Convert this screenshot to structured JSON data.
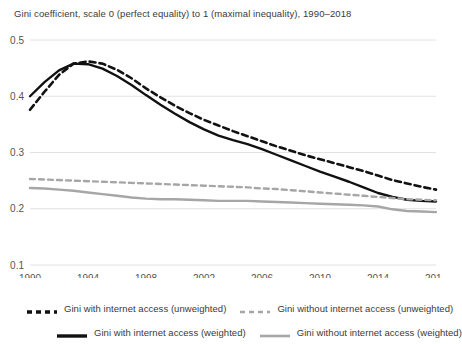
{
  "chart_data": {
    "type": "line",
    "title": "Gini coefficient, scale 0 (perfect equality) to 1 (maximal inequality), 1990–2018",
    "xlabel": "",
    "ylabel": "",
    "xlim": [
      1990,
      2018
    ],
    "ylim": [
      0.1,
      0.5
    ],
    "grid": true,
    "legend_position": "bottom",
    "yticks": [
      "0.1",
      "0.2",
      "0.3",
      "0.4",
      "0.5"
    ],
    "ytick_values": [
      0.1,
      0.2,
      0.3,
      0.4,
      0.5
    ],
    "xticks": [
      "1990",
      "1994",
      "1998",
      "2002",
      "2006",
      "2010",
      "2014",
      "2018"
    ],
    "xtick_values": [
      1990,
      1994,
      1998,
      2002,
      2006,
      2010,
      2014,
      2018
    ],
    "x": [
      1990,
      1991,
      1992,
      1993,
      1994,
      1995,
      1996,
      1997,
      1998,
      1999,
      2000,
      2001,
      2002,
      2003,
      2004,
      2005,
      2006,
      2007,
      2008,
      2009,
      2010,
      2011,
      2012,
      2013,
      2014,
      2015,
      2016,
      2017,
      2018
    ],
    "series": [
      {
        "name": "Gini with internet access (unweighted)",
        "style": "dashed",
        "color": "#111111",
        "width": 2.6,
        "values": [
          0.376,
          0.408,
          0.438,
          0.458,
          0.462,
          0.458,
          0.447,
          0.432,
          0.414,
          0.398,
          0.383,
          0.37,
          0.358,
          0.348,
          0.338,
          0.329,
          0.32,
          0.311,
          0.303,
          0.295,
          0.288,
          0.281,
          0.274,
          0.267,
          0.259,
          0.251,
          0.245,
          0.239,
          0.234
        ]
      },
      {
        "name": "Gini with internet access (weighted)",
        "style": "solid",
        "color": "#111111",
        "width": 2.4,
        "values": [
          0.4,
          0.425,
          0.446,
          0.458,
          0.457,
          0.449,
          0.436,
          0.42,
          0.402,
          0.385,
          0.369,
          0.354,
          0.341,
          0.33,
          0.322,
          0.315,
          0.306,
          0.296,
          0.286,
          0.276,
          0.266,
          0.257,
          0.248,
          0.238,
          0.228,
          0.221,
          0.216,
          0.214,
          0.213
        ]
      },
      {
        "name": "Gini without internet access (unweighted)",
        "style": "dashed",
        "color": "#a6a6a6",
        "width": 2.4,
        "values": [
          0.253,
          0.252,
          0.251,
          0.25,
          0.249,
          0.248,
          0.247,
          0.246,
          0.245,
          0.244,
          0.243,
          0.242,
          0.241,
          0.24,
          0.239,
          0.238,
          0.236,
          0.235,
          0.233,
          0.231,
          0.229,
          0.227,
          0.225,
          0.223,
          0.221,
          0.219,
          0.217,
          0.216,
          0.215
        ]
      },
      {
        "name": "Gini without internet access (weighted)",
        "style": "solid",
        "color": "#a6a6a6",
        "width": 2.4,
        "values": [
          0.237,
          0.236,
          0.234,
          0.232,
          0.229,
          0.226,
          0.223,
          0.22,
          0.218,
          0.217,
          0.217,
          0.216,
          0.215,
          0.214,
          0.214,
          0.214,
          0.213,
          0.212,
          0.211,
          0.21,
          0.209,
          0.208,
          0.207,
          0.206,
          0.204,
          0.199,
          0.196,
          0.195,
          0.194
        ]
      }
    ]
  },
  "colors": {
    "dark": "#111111",
    "gray": "#a6a6a6",
    "grid": "#e2e2e2",
    "text": "#3a3a3a",
    "background": "#ffffff"
  },
  "legend": {
    "items": [
      {
        "label": "Gini with internet access (unweighted)",
        "style": "dashed",
        "color": "#111111"
      },
      {
        "label": "Gini without internet access (unweighted)",
        "style": "dashed",
        "color": "#a6a6a6"
      },
      {
        "label": "Gini with internet access (weighted)",
        "style": "solid",
        "color": "#111111"
      },
      {
        "label": "Gini without internet access (weighted)",
        "style": "solid",
        "color": "#a6a6a6"
      }
    ]
  }
}
